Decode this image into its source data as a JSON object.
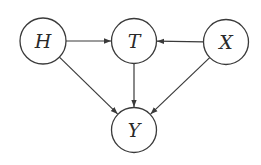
{
  "diagram": {
    "type": "directed-acyclic-graph",
    "stroke_color": "#3a3a3a",
    "background_color": "#ffffff",
    "nodes": [
      {
        "id": "H",
        "label": "H",
        "cx": 43,
        "cy": 41,
        "r": 23
      },
      {
        "id": "T",
        "label": "T",
        "cx": 134,
        "cy": 41,
        "r": 22.5
      },
      {
        "id": "X",
        "label": "X",
        "cx": 226,
        "cy": 42,
        "r": 22.5
      },
      {
        "id": "Y",
        "label": "Y",
        "cx": 134,
        "cy": 130,
        "r": 22.5
      }
    ],
    "edges": [
      {
        "from": "H",
        "to": "T"
      },
      {
        "from": "X",
        "to": "T"
      },
      {
        "from": "H",
        "to": "Y"
      },
      {
        "from": "T",
        "to": "Y"
      },
      {
        "from": "X",
        "to": "Y"
      }
    ]
  }
}
